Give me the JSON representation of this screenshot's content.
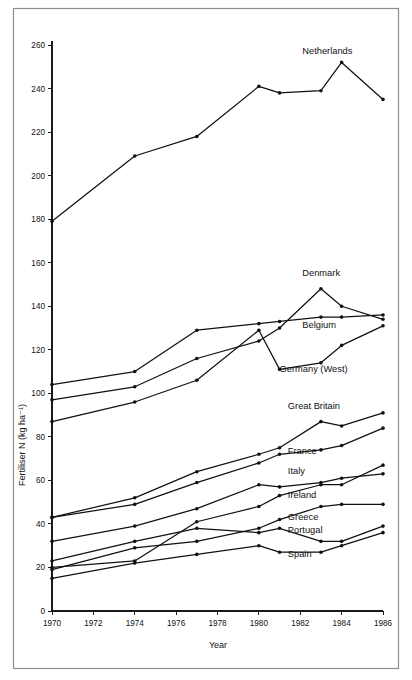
{
  "figure": {
    "type": "line-chart",
    "frame": {
      "border_color": "#8d8d8d",
      "background": "#ffffff"
    },
    "ink_color": "#111111"
  },
  "axes": {
    "y_title": "Fertiliser N (kg ha⁻¹)",
    "x_title": "Year",
    "y_ticks": [
      "0",
      "20",
      "40",
      "60",
      "80",
      "100",
      "120",
      "140",
      "160",
      "180",
      "200",
      "220",
      "240",
      "260"
    ],
    "x_ticks": [
      "1970",
      "1972",
      "1974",
      "1976",
      "1978",
      "1980",
      "1982",
      "1984",
      "1986"
    ]
  },
  "chart_data": {
    "type": "line",
    "title": "",
    "subtitle": "",
    "xlabel": "Year",
    "ylabel": "Fertiliser N (kg ha⁻¹)",
    "xlim": [
      1970,
      1986
    ],
    "ylim": [
      0,
      265
    ],
    "xticks": [
      1970,
      1972,
      1974,
      1976,
      1978,
      1980,
      1982,
      1984,
      1986
    ],
    "yticks": [
      0,
      20,
      40,
      60,
      80,
      100,
      120,
      140,
      160,
      180,
      200,
      220,
      240,
      260
    ],
    "grid": false,
    "legend": "inline-labels-right",
    "marker": "filled-circle",
    "series": [
      {
        "name": "Netherlands",
        "label_x": 1982.1,
        "label_y": 256,
        "points": [
          [
            1970,
            179
          ],
          [
            1974,
            209
          ],
          [
            1977,
            218
          ],
          [
            1980,
            241
          ],
          [
            1981,
            238
          ],
          [
            1983,
            239
          ],
          [
            1984,
            252
          ],
          [
            1986,
            235
          ]
        ]
      },
      {
        "name": "Denmark",
        "label_x": 1982.1,
        "label_y": 154,
        "points": [
          [
            1970,
            97
          ],
          [
            1974,
            103
          ],
          [
            1977,
            116
          ],
          [
            1980,
            124
          ],
          [
            1981,
            130
          ],
          [
            1983,
            148
          ],
          [
            1984,
            140
          ],
          [
            1986,
            134
          ]
        ]
      },
      {
        "name": "Belgium",
        "label_x": 1982.1,
        "label_y": 130,
        "points": [
          [
            1970,
            104
          ],
          [
            1974,
            110
          ],
          [
            1977,
            129
          ],
          [
            1980,
            132
          ],
          [
            1981,
            133
          ],
          [
            1983,
            135
          ],
          [
            1984,
            135
          ],
          [
            1986,
            136
          ]
        ]
      },
      {
        "name": "Germany (West)",
        "label_x": 1981.0,
        "label_y": 110,
        "points": [
          [
            1970,
            87
          ],
          [
            1974,
            96
          ],
          [
            1977,
            106
          ],
          [
            1980,
            129
          ],
          [
            1981,
            111
          ],
          [
            1983,
            114
          ],
          [
            1984,
            122
          ],
          [
            1986,
            131
          ]
        ]
      },
      {
        "name": "Great Britain",
        "label_x": 1981.4,
        "label_y": 93,
        "points": [
          [
            1970,
            43
          ],
          [
            1974,
            52
          ],
          [
            1977,
            64
          ],
          [
            1980,
            72
          ],
          [
            1981,
            75
          ],
          [
            1983,
            87
          ],
          [
            1984,
            85
          ],
          [
            1986,
            91
          ]
        ]
      },
      {
        "name": "France",
        "label_x": 1981.4,
        "label_y": 72,
        "points": [
          [
            1970,
            43
          ],
          [
            1974,
            49
          ],
          [
            1977,
            59
          ],
          [
            1980,
            68
          ],
          [
            1981,
            72
          ],
          [
            1983,
            74
          ],
          [
            1984,
            76
          ],
          [
            1986,
            84
          ]
        ]
      },
      {
        "name": "Italy",
        "label_x": 1981.4,
        "label_y": 63,
        "points": [
          [
            1970,
            20
          ],
          [
            1974,
            23
          ],
          [
            1977,
            41
          ],
          [
            1980,
            48
          ],
          [
            1981,
            53
          ],
          [
            1983,
            58
          ],
          [
            1984,
            58
          ],
          [
            1986,
            67
          ]
        ]
      },
      {
        "name": "Ireland",
        "label_x": 1981.4,
        "label_y": 52,
        "points": [
          [
            1970,
            32
          ],
          [
            1974,
            39
          ],
          [
            1977,
            47
          ],
          [
            1980,
            58
          ],
          [
            1981,
            57
          ],
          [
            1983,
            59
          ],
          [
            1984,
            61
          ],
          [
            1986,
            63
          ]
        ]
      },
      {
        "name": "Greece",
        "label_x": 1981.4,
        "label_y": 42,
        "points": [
          [
            1970,
            23
          ],
          [
            1974,
            32
          ],
          [
            1977,
            38
          ],
          [
            1980,
            36
          ],
          [
            1981,
            38
          ],
          [
            1983,
            32
          ],
          [
            1984,
            32
          ],
          [
            1986,
            39
          ]
        ]
      },
      {
        "name": "Portugal",
        "label_x": 1981.4,
        "label_y": 36,
        "points": [
          [
            1970,
            19
          ],
          [
            1974,
            29
          ],
          [
            1977,
            32
          ],
          [
            1980,
            38
          ],
          [
            1981,
            42
          ],
          [
            1983,
            48
          ],
          [
            1984,
            49
          ],
          [
            1986,
            49
          ]
        ]
      },
      {
        "name": "Spain",
        "label_x": 1981.4,
        "label_y": 25,
        "points": [
          [
            1970,
            15
          ],
          [
            1974,
            22
          ],
          [
            1977,
            26
          ],
          [
            1980,
            30
          ],
          [
            1981,
            27
          ],
          [
            1983,
            27
          ],
          [
            1984,
            30
          ],
          [
            1986,
            36
          ]
        ]
      }
    ]
  }
}
